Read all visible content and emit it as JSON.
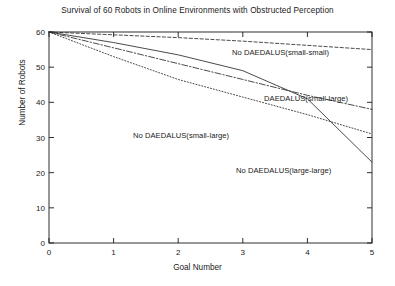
{
  "chart_data": {
    "type": "line",
    "title": "Survival of 60 Robots in Online Environments with Obstructed Perception",
    "xlabel": "Goal Number",
    "ylabel": "Number of Robots",
    "xlim": [
      0,
      5
    ],
    "ylim": [
      0,
      60
    ],
    "xticks": [
      "0",
      "1",
      "2",
      "3",
      "4",
      "5"
    ],
    "yticks": [
      "0",
      "10",
      "20",
      "30",
      "40",
      "50",
      "60"
    ],
    "grid": false,
    "legend_position": "inline-annotations",
    "x": [
      0,
      1,
      2,
      3,
      4,
      5
    ],
    "series": [
      {
        "name": "No DAEDALUS(small-small)",
        "style": "dotted",
        "values": [
          60,
          59.2,
          58.4,
          57.4,
          56.2,
          55.0
        ]
      },
      {
        "name": "DAEDALUS(small-large)",
        "style": "dash-dot",
        "values": [
          60,
          55.5,
          51.0,
          46.5,
          42.0,
          38.0
        ]
      },
      {
        "name": "No DAEDALUS(small-large)",
        "style": "fine-dotted",
        "values": [
          60,
          53.0,
          46.5,
          41.5,
          36.5,
          31.0
        ]
      },
      {
        "name": "No DAEDALUS(large-large)",
        "style": "solid",
        "values": [
          60,
          57.0,
          53.5,
          49.0,
          41.0,
          23.0
        ]
      }
    ],
    "annotations": [
      {
        "text": "No DAEDALUS(small-small)",
        "x_px": 232,
        "y_px": 48
      },
      {
        "text": "DAEDALUS(small-large)",
        "x_px": 264,
        "y_px": 94
      },
      {
        "text": "No DAEDALUS(small-large)",
        "x_px": 133,
        "y_px": 131
      },
      {
        "text": "No DAEDALUS(large-large)",
        "x_px": 236,
        "y_px": 166
      }
    ]
  }
}
